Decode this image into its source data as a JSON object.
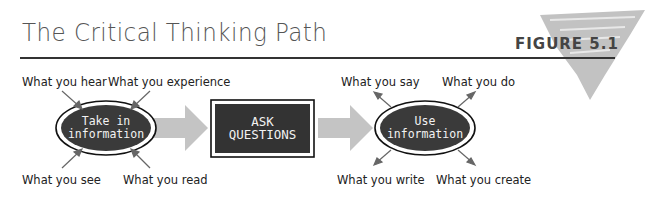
{
  "header": {
    "title": "The Critical Thinking Path",
    "figure_label": "FIGURE 5.1"
  },
  "diagram": {
    "nodes": [
      {
        "id": "take",
        "label_line1": "Take in",
        "label_line2": "information",
        "shape": "ellipse"
      },
      {
        "id": "ask",
        "label_line1": "ASK",
        "label_line2": "QUESTIONS",
        "shape": "rectangle"
      },
      {
        "id": "use",
        "label_line1": "Use",
        "label_line2": "information",
        "shape": "ellipse"
      }
    ],
    "inputs": [
      "What you hear",
      "What you experience",
      "What you see",
      "What you read"
    ],
    "outputs": [
      "What you say",
      "What you do",
      "What you write",
      "What you create"
    ],
    "colors": {
      "node_fill": "#3a3a3a",
      "arrow_fill": "#c4c4c4",
      "splotch": "#bdbdbd",
      "rule": "#333333"
    }
  }
}
